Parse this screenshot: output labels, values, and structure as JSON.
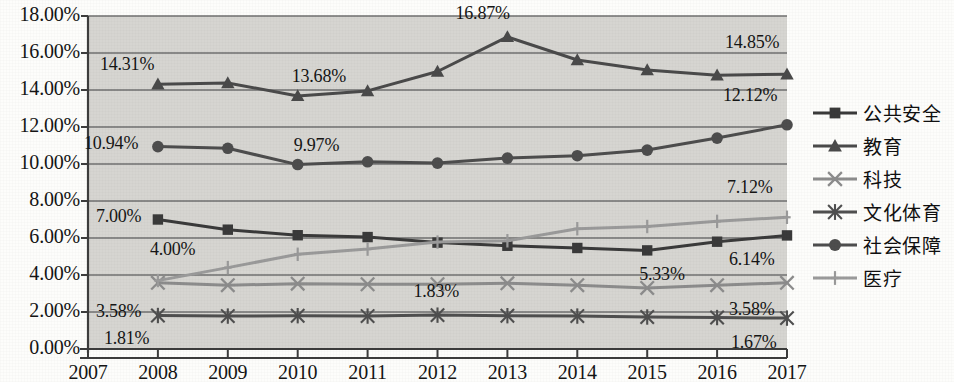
{
  "chart_data": {
    "type": "line",
    "title": "",
    "xlabel": "",
    "ylabel": "",
    "grid": true,
    "legend_position": "right",
    "x": [
      "2007",
      "2008",
      "2009",
      "2010",
      "2011",
      "2012",
      "2013",
      "2014",
      "2015",
      "2016",
      "2017"
    ],
    "xlim": [
      2007,
      2017
    ],
    "ylim": [
      0,
      18
    ],
    "ytick_labels": [
      "0.00%",
      "2.00%",
      "4.00%",
      "6.00%",
      "8.00%",
      "10.00%",
      "12.00%",
      "14.00%",
      "16.00%",
      "18.00%"
    ],
    "ytick_values": [
      0,
      2,
      4,
      6,
      8,
      10,
      12,
      14,
      16,
      18
    ],
    "series": [
      {
        "name": "公共安全",
        "marker": "square",
        "color": "#3a3a3a",
        "x": [
          "2008",
          "2009",
          "2010",
          "2011",
          "2012",
          "2013",
          "2014",
          "2015",
          "2016",
          "2017"
        ],
        "values": [
          7.0,
          6.45,
          6.15,
          6.05,
          5.75,
          5.58,
          5.46,
          5.33,
          5.8,
          6.14
        ]
      },
      {
        "name": "教育",
        "marker": "triangle",
        "color": "#4a4a4a",
        "x": [
          "2008",
          "2009",
          "2010",
          "2011",
          "2012",
          "2013",
          "2014",
          "2015",
          "2016",
          "2017"
        ],
        "values": [
          14.31,
          14.38,
          13.68,
          13.95,
          15.0,
          16.87,
          15.62,
          15.08,
          14.8,
          14.85
        ]
      },
      {
        "name": "科技",
        "marker": "x",
        "color": "#8c8c8c",
        "x": [
          "2008",
          "2009",
          "2010",
          "2011",
          "2012",
          "2013",
          "2014",
          "2015",
          "2016",
          "2017"
        ],
        "values": [
          3.58,
          3.45,
          3.53,
          3.5,
          3.5,
          3.55,
          3.45,
          3.3,
          3.45,
          3.58
        ]
      },
      {
        "name": "文化体育",
        "marker": "asterisk",
        "color": "#4f4f4f",
        "x": [
          "2008",
          "2009",
          "2010",
          "2011",
          "2012",
          "2013",
          "2014",
          "2015",
          "2016",
          "2017"
        ],
        "values": [
          1.81,
          1.78,
          1.8,
          1.78,
          1.83,
          1.8,
          1.78,
          1.73,
          1.7,
          1.67
        ]
      },
      {
        "name": "社会保障",
        "marker": "circle",
        "color": "#4d4d4d",
        "x": [
          "2008",
          "2009",
          "2010",
          "2011",
          "2012",
          "2013",
          "2014",
          "2015",
          "2016",
          "2017"
        ],
        "values": [
          10.94,
          10.85,
          9.97,
          10.12,
          10.05,
          10.32,
          10.45,
          10.75,
          11.4,
          12.12
        ]
      },
      {
        "name": "医疗",
        "marker": "plus",
        "color": "#9a9a9a",
        "x": [
          "2008",
          "2009",
          "2010",
          "2011",
          "2012",
          "2013",
          "2014",
          "2015",
          "2016",
          "2017"
        ],
        "values": [
          3.7,
          4.4,
          5.12,
          5.4,
          5.78,
          5.85,
          6.5,
          6.62,
          6.9,
          7.12
        ]
      }
    ],
    "data_labels": [
      {
        "text": "14.31%",
        "series": "教育",
        "x": "2008",
        "value": 14.31
      },
      {
        "text": "13.68%",
        "series": "教育",
        "x": "2010",
        "value": 13.68
      },
      {
        "text": "16.87%",
        "series": "教育",
        "x": "2012",
        "value": 16.87
      },
      {
        "text": "14.85%",
        "series": "教育",
        "x": "2017",
        "value": 14.85
      },
      {
        "text": "10.94%",
        "series": "社会保障",
        "x": "2008",
        "value": 10.94
      },
      {
        "text": "9.97%",
        "series": "社会保障",
        "x": "2010",
        "value": 9.97
      },
      {
        "text": "12.12%",
        "series": "社会保障",
        "x": "2017",
        "value": 12.12
      },
      {
        "text": "7.00%",
        "series": "公共安全",
        "x": "2008",
        "value": 7.0
      },
      {
        "text": "5.33%",
        "series": "公共安全",
        "x": "2015",
        "value": 5.33
      },
      {
        "text": "6.14%",
        "series": "公共安全",
        "x": "2017",
        "value": 6.14
      },
      {
        "text": "4.00%",
        "series": "医疗",
        "x": "2008",
        "value": 4.0
      },
      {
        "text": "7.12%",
        "series": "医疗",
        "x": "2017",
        "value": 7.12
      },
      {
        "text": "3.58%",
        "series": "科技",
        "x": "2008",
        "value": 3.58
      },
      {
        "text": "3.58%",
        "series": "科技",
        "x": "2017",
        "value": 3.58
      },
      {
        "text": "1.81%",
        "series": "文化体育",
        "x": "2008",
        "value": 1.81
      },
      {
        "text": "1.83%",
        "series": "文化体育",
        "x": "2012",
        "value": 1.83
      },
      {
        "text": "1.67%",
        "series": "文化体育",
        "x": "2017",
        "value": 1.67
      }
    ]
  },
  "style": {
    "plot_background": "#d6d5d1",
    "grid_color": "#6f6f6f",
    "axis_color": "#3d3d3d",
    "page_background": "#fdfdfb"
  }
}
